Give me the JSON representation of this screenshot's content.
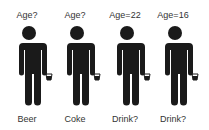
{
  "colors": {
    "figure": "#1a1a1a",
    "text": "#333333",
    "background": "#ffffff"
  },
  "people": [
    {
      "top_label": "Age?",
      "bottom_label": "Beer",
      "icon": "person-with-cup-icon"
    },
    {
      "top_label": "Age?",
      "bottom_label": "Coke",
      "icon": "person-with-cup-icon"
    },
    {
      "top_label": "Age=22",
      "bottom_label": "Drink?",
      "icon": "person-with-cup-icon"
    },
    {
      "top_label": "Age=16",
      "bottom_label": "Drink?",
      "icon": "person-with-cup-icon"
    }
  ]
}
